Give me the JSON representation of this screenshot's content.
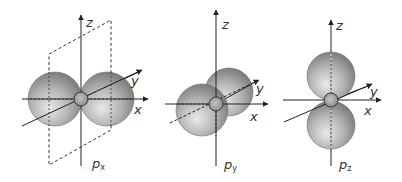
{
  "colors": {
    "axis": "#222222",
    "lobe_light": "#e9e9e9",
    "lobe_mid": "#b5b5b5",
    "lobe_dark": "#7d7d7d",
    "lobe_stroke": "#6f6f6f",
    "nucleus": "#9a9a9a",
    "nucleus_stroke": "#333333",
    "plane": "#333333"
  },
  "panels": [
    {
      "id": "px",
      "orbital_letter": "p",
      "orbital_subscript": "x",
      "lobe_axis": "x",
      "nodal_plane_shown": true,
      "axis_labels": {
        "x": "x",
        "y": "y",
        "z": "z"
      }
    },
    {
      "id": "py",
      "orbital_letter": "p",
      "orbital_subscript": "y",
      "lobe_axis": "y",
      "nodal_plane_shown": false,
      "axis_labels": {
        "x": "x",
        "y": "y",
        "z": "z"
      }
    },
    {
      "id": "pz",
      "orbital_letter": "p",
      "orbital_subscript": "z",
      "lobe_axis": "z",
      "nodal_plane_shown": false,
      "axis_labels": {
        "x": "x",
        "y": "y",
        "z": "z"
      }
    }
  ]
}
